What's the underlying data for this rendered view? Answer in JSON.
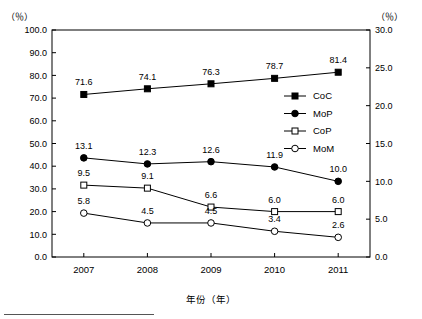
{
  "chart_data": {
    "type": "line",
    "title": "",
    "xlabel": "年份（年）",
    "ylabel_left": "（％）",
    "ylabel_right": "（％）",
    "categories": [
      "2007",
      "2008",
      "2009",
      "2010",
      "2011"
    ],
    "y_left": {
      "min": 0.0,
      "max": 100.0,
      "step": 10.0,
      "ticks": [
        "0.0",
        "10.0",
        "20.0",
        "30.0",
        "40.0",
        "50.0",
        "60.0",
        "70.0",
        "80.0",
        "90.0",
        "100.0"
      ]
    },
    "y_right": {
      "min": 0.0,
      "max": 30.0,
      "step": 5.0,
      "ticks": [
        "0.0",
        "5.0",
        "10.0",
        "15.0",
        "20.0",
        "25.0",
        "30.0"
      ]
    },
    "grid": false,
    "legend_position": "inside-right-top",
    "series": [
      {
        "name": "CoC",
        "axis": "left",
        "marker": "filled-square",
        "values": [
          71.6,
          74.1,
          76.3,
          78.7,
          81.4
        ],
        "labels": [
          "71.6",
          "74.1",
          "76.3",
          "78.7",
          "81.4"
        ]
      },
      {
        "name": "MoP",
        "axis": "right",
        "marker": "filled-circle",
        "values": [
          13.1,
          12.3,
          12.6,
          11.9,
          10.0
        ],
        "labels": [
          "13.1",
          "12.3",
          "12.6",
          "11.9",
          "10.0"
        ]
      },
      {
        "name": "CoP",
        "axis": "right",
        "marker": "open-square",
        "values": [
          9.5,
          9.1,
          6.6,
          6.0,
          6.0
        ],
        "labels": [
          "9.5",
          "9.1",
          "6.6",
          "6.0",
          "6.0"
        ]
      },
      {
        "name": "MoM",
        "axis": "right",
        "marker": "open-circle",
        "values": [
          5.8,
          4.5,
          4.5,
          3.4,
          2.6
        ],
        "labels": [
          "5.8",
          "4.5",
          "4.5",
          "3.4",
          "2.6"
        ]
      }
    ],
    "colors": {
      "line": "#000000",
      "frame": "#000000",
      "background": "#ffffff"
    }
  }
}
